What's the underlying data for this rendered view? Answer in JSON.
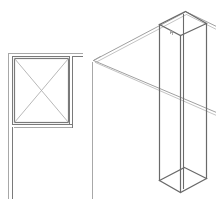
{
  "canvas": {
    "width": 216,
    "height": 205,
    "background": "#ffffff"
  },
  "colors": {
    "wall": "#7a7a7a",
    "wall_light": "#a8a8a8",
    "cross": "#b0b0b0",
    "column": "#6a6a6a",
    "floor": "#a0a0a0",
    "floor_light": "#c4c4c4"
  },
  "plan_view": {
    "label": "",
    "walls": [
      {
        "name": "top-wall-outer",
        "x1": 8,
        "y1": 53,
        "x2": 82,
        "y2": 53,
        "tone": "wall_light",
        "w": 1
      },
      {
        "name": "top-wall-inner",
        "x1": 12,
        "y1": 56,
        "x2": 69,
        "y2": 56,
        "tone": "wall",
        "w": 1
      },
      {
        "name": "top-wall-inner-right",
        "x1": 72,
        "y1": 56,
        "x2": 82,
        "y2": 56,
        "tone": "wall",
        "w": 1
      },
      {
        "name": "left-wall-outer",
        "x1": 8,
        "y1": 53,
        "x2": 8,
        "y2": 198,
        "tone": "wall_light",
        "w": 1
      },
      {
        "name": "left-wall-inner-upper",
        "x1": 12,
        "y1": 56,
        "x2": 12,
        "y2": 124,
        "tone": "wall",
        "w": 1
      },
      {
        "name": "left-wall-inner-lower",
        "x1": 12,
        "y1": 127,
        "x2": 12,
        "y2": 198,
        "tone": "wall",
        "w": 1
      },
      {
        "name": "ledge-bottom-outer",
        "x1": 12,
        "y1": 124,
        "x2": 72,
        "y2": 124,
        "tone": "wall",
        "w": 1
      },
      {
        "name": "ledge-bottom-inner",
        "x1": 14,
        "y1": 127,
        "x2": 72,
        "y2": 127,
        "tone": "wall_light",
        "w": 1
      },
      {
        "name": "right-wall-left",
        "x1": 69,
        "y1": 56,
        "x2": 69,
        "y2": 124,
        "tone": "wall",
        "w": 1
      },
      {
        "name": "right-wall-right",
        "x1": 72,
        "y1": 56,
        "x2": 72,
        "y2": 127,
        "tone": "wall",
        "w": 1
      },
      {
        "name": "divider-line",
        "x1": 92,
        "y1": 62,
        "x2": 92,
        "y2": 198,
        "tone": "wall_light",
        "w": 1
      }
    ],
    "box": {
      "x": 14,
      "y": 58,
      "w": 54,
      "h": 64
    },
    "cross_lines": [
      {
        "name": "diag-1",
        "x1": 14,
        "y1": 58,
        "x2": 68,
        "y2": 122
      },
      {
        "name": "diag-2",
        "x1": 68,
        "y1": 58,
        "x2": 14,
        "y2": 122
      }
    ]
  },
  "iso_view": {
    "floor_edges": [
      {
        "name": "floor-back-left-a",
        "x1": 93,
        "y1": 60,
        "x2": 184,
        "y2": 12,
        "tone": "floor"
      },
      {
        "name": "floor-back-left-b",
        "x1": 95,
        "y1": 62,
        "x2": 186,
        "y2": 14,
        "tone": "floor_light"
      },
      {
        "name": "floor-back-right-a",
        "x1": 185,
        "y1": 11,
        "x2": 216,
        "y2": 26,
        "tone": "floor"
      },
      {
        "name": "floor-back-right-b",
        "x1": 186,
        "y1": 14,
        "x2": 216,
        "y2": 29,
        "tone": "floor_light"
      },
      {
        "name": "floor-front-a",
        "x1": 93,
        "y1": 60,
        "x2": 216,
        "y2": 112,
        "tone": "floor"
      },
      {
        "name": "floor-front-b",
        "x1": 95,
        "y1": 62,
        "x2": 216,
        "y2": 115,
        "tone": "floor_light"
      },
      {
        "name": "floor-corner-tick",
        "x1": 93,
        "y1": 60,
        "x2": 100,
        "y2": 56,
        "tone": "floor"
      }
    ],
    "column": {
      "top": [
        [
          185,
          11
        ],
        [
          206,
          23
        ],
        [
          180,
          35
        ],
        [
          159,
          24
        ]
      ],
      "bottom": [
        [
          184,
          167
        ],
        [
          206,
          178
        ],
        [
          180,
          192
        ],
        [
          159,
          180
        ]
      ],
      "extra_verticals": [
        {
          "name": "inner-edge",
          "x1": 183,
          "y1": 14,
          "x2": 183,
          "y2": 188
        }
      ],
      "top_detail": [
        {
          "name": "tick-1",
          "x1": 170,
          "y1": 30,
          "x2": 170,
          "y2": 33
        },
        {
          "name": "tick-2",
          "x1": 172,
          "y1": 31,
          "x2": 172,
          "y2": 34
        },
        {
          "name": "tick-3",
          "x1": 170,
          "y1": 32,
          "x2": 173,
          "y2": 32
        }
      ]
    }
  }
}
